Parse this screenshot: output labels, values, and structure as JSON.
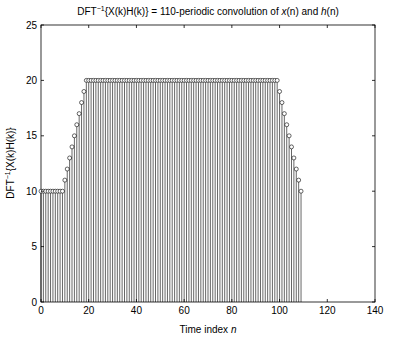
{
  "chart_data": {
    "type": "stem",
    "title_parts": {
      "pre": "DFT",
      "sup": "−1",
      "mid": "{X(k)H(k)} = 110-periodic convolution of ",
      "x": "x",
      "xn": "(n)",
      "and": " and ",
      "h": "h",
      "hn": "(n)"
    },
    "xlabel": "Time index n",
    "xlabel_parts": {
      "text": "Time index ",
      "var": "n"
    },
    "ylabel": "DFT⁻¹{X(k)H(k)}",
    "ylabel_parts": {
      "pre": "DFT",
      "sup": "−1",
      "post": "{X(k)H(k)}"
    },
    "xlim": [
      0,
      140
    ],
    "ylim": [
      0,
      25
    ],
    "xticks": [
      0,
      20,
      40,
      60,
      80,
      100,
      120,
      140
    ],
    "yticks": [
      0,
      5,
      10,
      15,
      20,
      25
    ],
    "grid": false,
    "marker": "open-circle",
    "n_start": 0,
    "n_end": 109,
    "values": [
      10,
      10,
      10,
      10,
      10,
      10,
      10,
      10,
      10,
      10,
      11,
      12,
      13,
      14,
      15,
      16,
      17,
      18,
      19,
      20,
      20,
      20,
      20,
      20,
      20,
      20,
      20,
      20,
      20,
      20,
      20,
      20,
      20,
      20,
      20,
      20,
      20,
      20,
      20,
      20,
      20,
      20,
      20,
      20,
      20,
      20,
      20,
      20,
      20,
      20,
      20,
      20,
      20,
      20,
      20,
      20,
      20,
      20,
      20,
      20,
      20,
      20,
      20,
      20,
      20,
      20,
      20,
      20,
      20,
      20,
      20,
      20,
      20,
      20,
      20,
      20,
      20,
      20,
      20,
      20,
      20,
      20,
      20,
      20,
      20,
      20,
      20,
      20,
      20,
      20,
      20,
      20,
      20,
      20,
      20,
      20,
      20,
      20,
      20,
      20,
      19,
      18,
      17,
      16,
      15,
      14,
      13,
      12,
      11,
      10
    ]
  }
}
